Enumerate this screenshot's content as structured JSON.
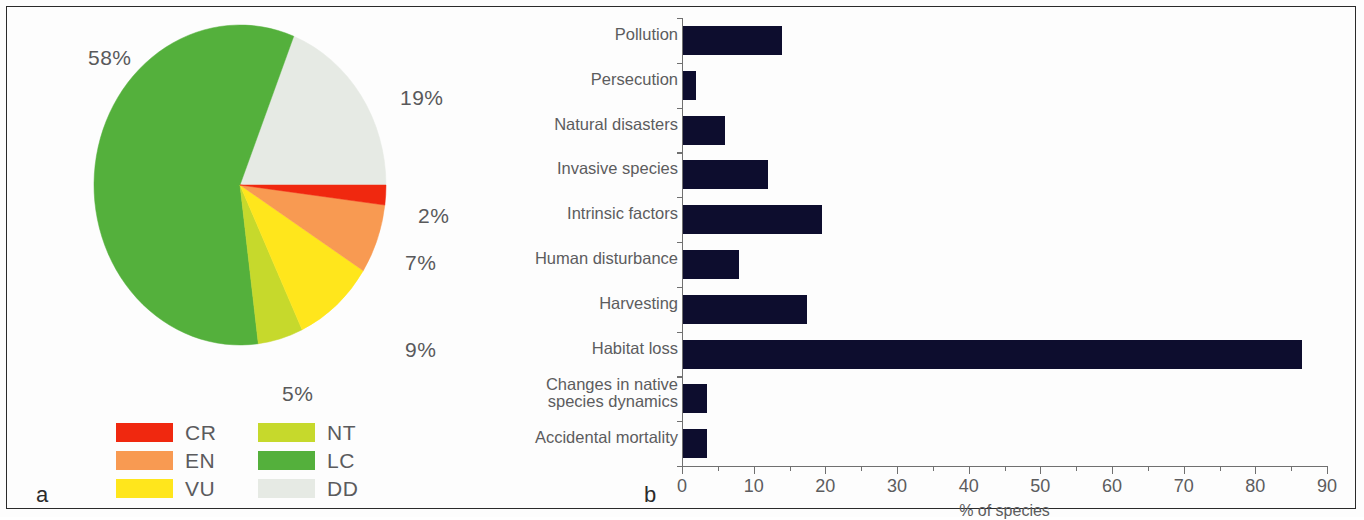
{
  "figure": {
    "panel_a_letter": "a",
    "panel_b_letter": "b"
  },
  "chart_data": [
    {
      "type": "pie",
      "title": "",
      "panel": "a",
      "categories": [
        "LC",
        "DD",
        "CR",
        "EN",
        "VU",
        "NT"
      ],
      "values": [
        58,
        19,
        2,
        7,
        9,
        5
      ],
      "labels": [
        "58%",
        "19%",
        "2%",
        "7%",
        "9%",
        "5%"
      ],
      "colors": [
        "#54b03c",
        "#e6eae4",
        "#f0280f",
        "#f89a52",
        "#ffe61c",
        "#c6d92c"
      ],
      "legend_position": "bottom",
      "legend": [
        {
          "code": "CR",
          "color": "#f0280f"
        },
        {
          "code": "NT",
          "color": "#c6d92c"
        },
        {
          "code": "EN",
          "color": "#f89a52"
        },
        {
          "code": "LC",
          "color": "#54b03c"
        },
        {
          "code": "VU",
          "color": "#ffe61c"
        },
        {
          "code": "DD",
          "color": "#e6eae4"
        }
      ],
      "slice_labels": [
        {
          "text": "58%",
          "x": 28,
          "y": 38
        },
        {
          "text": "19%",
          "x": 340,
          "y": 78
        },
        {
          "text": "2%",
          "x": 358,
          "y": 196
        },
        {
          "text": "7%",
          "x": 345,
          "y": 243
        },
        {
          "text": "9%",
          "x": 345,
          "y": 330
        },
        {
          "text": "5%",
          "x": 222,
          "y": 374
        }
      ]
    },
    {
      "type": "bar",
      "orientation": "horizontal",
      "panel": "b",
      "title": "",
      "xlabel": "% of species",
      "ylabel": "",
      "xlim": [
        0,
        90
      ],
      "xticks": [
        0,
        10,
        20,
        30,
        40,
        50,
        60,
        70,
        80,
        90
      ],
      "xtick_labels": [
        "0",
        "10",
        "20",
        "30",
        "40",
        "50",
        "60",
        "70",
        "80",
        "90"
      ],
      "minor_tick_step": 5,
      "grid": false,
      "bar_color": "#0d0d2e",
      "categories": [
        "Pollution",
        "Persecution",
        "Natural disasters",
        "Invasive species",
        "Intrinsic factors",
        "Human disturbance",
        "Harvesting",
        "Habitat loss",
        "Changes in native\nspecies dynamics",
        "Accidental mortality"
      ],
      "values": [
        14,
        2,
        6,
        12,
        19.5,
        8,
        17.5,
        86.5,
        3.5,
        3.5
      ]
    }
  ]
}
